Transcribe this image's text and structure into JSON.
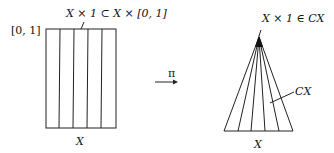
{
  "diagram": {
    "left": {
      "top_label": "X × 1 ⊂ X × [0, 1]",
      "side_label": "[0, 1]",
      "bottom_label": "X",
      "fibers": 5
    },
    "arrow": {
      "label": "π"
    },
    "right": {
      "apex_label": "X × 1 ∈ CX",
      "cone_label": "CX",
      "bottom_label": "X",
      "fibers": 6
    }
  }
}
